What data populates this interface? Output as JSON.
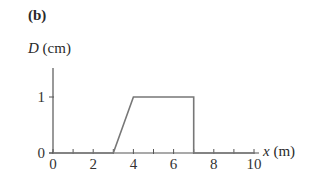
{
  "panel_label": "(b)",
  "y_axis": {
    "var": "D",
    "unit": "(cm)"
  },
  "x_axis": {
    "var": "x",
    "unit": "(m)"
  },
  "chart_data": {
    "type": "line",
    "title": "(b)",
    "xlabel": "x (m)",
    "ylabel": "D (cm)",
    "xlim": [
      0,
      10
    ],
    "ylim": [
      0,
      1.5
    ],
    "x_ticks": [
      0,
      1,
      2,
      3,
      4,
      5,
      6,
      7,
      8,
      9,
      10
    ],
    "x_tick_labels": [
      "0",
      "2",
      "4",
      "6",
      "8",
      "10"
    ],
    "y_ticks": [
      0,
      1
    ],
    "y_tick_labels": [
      "0",
      "1"
    ],
    "grid": false,
    "legend": null,
    "series": [
      {
        "name": "D(x)",
        "x": [
          0,
          3,
          4,
          7,
          7,
          10
        ],
        "y": [
          0,
          0,
          1,
          1,
          0,
          0
        ]
      }
    ]
  },
  "style": {
    "line_color": "#777777",
    "axis_color": "#555555",
    "text_color": "#333333"
  }
}
